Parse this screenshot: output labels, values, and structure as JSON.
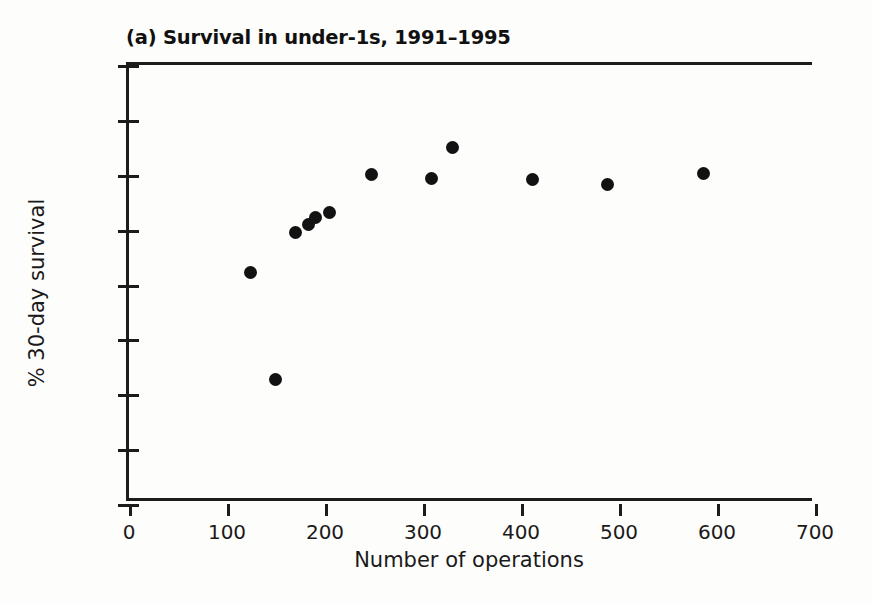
{
  "chart_data": {
    "type": "scatter",
    "title": "(a) Survival in under-1s, 1991–1995",
    "xlabel": "Number of operations",
    "ylabel": "% 30-day survival",
    "xlim": [
      0,
      700
    ],
    "ylim": [
      60,
      100
    ],
    "xticks": [
      0,
      100,
      200,
      300,
      400,
      500,
      600,
      700
    ],
    "yticks": [
      60,
      65,
      70,
      75,
      80,
      85,
      90,
      95,
      100
    ],
    "xtick_labels": [
      "0",
      "100",
      "200",
      "300",
      "400",
      "500",
      "600",
      "700"
    ],
    "ytick_labels": [
      "60",
      "65",
      "70",
      "75",
      "80",
      "85",
      "90",
      "95",
      "100"
    ],
    "grid": false,
    "legend": false,
    "marker": "filled-circle",
    "marker_color": "#121212",
    "points": [
      {
        "x": 124,
        "y": 81.1
      },
      {
        "x": 149,
        "y": 71.3
      },
      {
        "x": 170,
        "y": 84.7
      },
      {
        "x": 183,
        "y": 85.5
      },
      {
        "x": 190,
        "y": 86.1
      },
      {
        "x": 205,
        "y": 86.6
      },
      {
        "x": 247,
        "y": 90.0
      },
      {
        "x": 309,
        "y": 89.7
      },
      {
        "x": 330,
        "y": 92.5
      },
      {
        "x": 412,
        "y": 89.6
      },
      {
        "x": 488,
        "y": 89.1
      },
      {
        "x": 586,
        "y": 90.1
      }
    ]
  }
}
